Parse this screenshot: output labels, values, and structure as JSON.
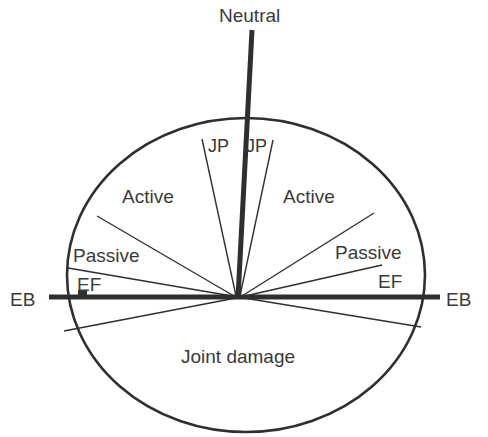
{
  "diagram": {
    "title": "Neutral",
    "colors": {
      "ink": "#2f2f2f",
      "text": "#3a3a3a",
      "background": "#ffffff"
    },
    "axes": {
      "vertical_label": "Neutral",
      "horizontal_left_label": "EB",
      "horizontal_right_label": "EB"
    },
    "regions": {
      "jp_left": "JP",
      "jp_right": "JP",
      "active_left": "Active",
      "active_right": "Active",
      "passive_left": "Passive",
      "passive_right": "Passive",
      "ef_left": "EF",
      "ef_right": "EF",
      "joint_damage": "Joint damage"
    },
    "geometry": {
      "ellipse": {
        "cx": 246,
        "cy": 275,
        "rx": 179,
        "ry": 157
      },
      "focal_point": {
        "x": 238,
        "y": 297
      },
      "neutral_line": {
        "x1": 252,
        "y1": 30,
        "x2": 238,
        "y2": 297
      },
      "eb_line": {
        "x1": 49,
        "y1": 297,
        "x2": 440,
        "y2": 297
      }
    }
  }
}
